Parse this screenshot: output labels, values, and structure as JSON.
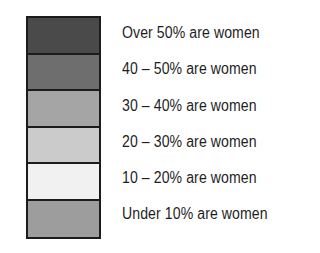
{
  "legend": {
    "items": [
      {
        "label": "Over 50% are women",
        "color": "#4a4a4a"
      },
      {
        "label": "40 – 50% are women",
        "color": "#6e6e6e"
      },
      {
        "label": "30 – 40% are women",
        "color": "#a5a5a5"
      },
      {
        "label": "20 – 30% are women",
        "color": "#cbcbcb"
      },
      {
        "label": "10 – 20% are women",
        "color": "#f1f1f1"
      },
      {
        "label": "Under 10% are women",
        "color": "#9d9d9d"
      }
    ]
  }
}
